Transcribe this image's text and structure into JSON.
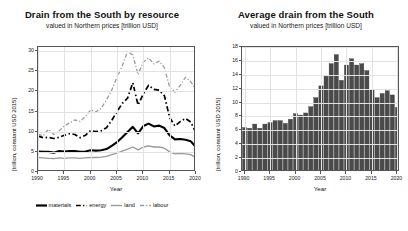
{
  "figure": {
    "background": "#ffffff",
    "panels": [
      "left",
      "right"
    ]
  },
  "left_panel": {
    "title": "Drain from the South by resource",
    "subtitle": "valued in Northern prices [trillion USD]",
    "ylabel": "[trillion, constant USD 2015]",
    "xlabel": "Year",
    "legend": [
      {
        "label": "materials",
        "color": "#000000",
        "style": "solid",
        "width": 2.2
      },
      {
        "label": "energy",
        "color": "#000000",
        "style": "dashdot",
        "width": 1.6
      },
      {
        "label": "land",
        "color": "#9a9a9a",
        "style": "solid",
        "width": 1.4
      },
      {
        "label": "labour",
        "color": "#9a9a9a",
        "style": "dashdot",
        "width": 1.4
      }
    ]
  },
  "right_panel": {
    "title": "Average drain from the South",
    "subtitle": "valued in Northern prices [trillion USD]",
    "ylabel": "[trillion, constant USD 2015]",
    "xlabel": "Year",
    "bar_color": "#4a4a4a"
  },
  "chart_data": [
    {
      "type": "line",
      "id": "drain-by-resource",
      "title": "Drain from the South by resource",
      "subtitle": "valued in Northern prices [trillion USD]",
      "xlabel": "Year",
      "ylabel": "[trillion, constant USD 2015]",
      "xlim": [
        1990,
        2020
      ],
      "ylim": [
        0,
        31
      ],
      "xticks": [
        1990,
        1995,
        2000,
        2005,
        2010,
        2015,
        2020
      ],
      "yticks": [
        0,
        5,
        10,
        15,
        20,
        25,
        30
      ],
      "grid": true,
      "legend_position": "below",
      "x": [
        1990,
        1991,
        1992,
        1993,
        1994,
        1995,
        1996,
        1997,
        1998,
        1999,
        2000,
        2001,
        2002,
        2003,
        2004,
        2005,
        2006,
        2007,
        2008,
        2009,
        2010,
        2011,
        2012,
        2013,
        2014,
        2015,
        2016,
        2017,
        2018,
        2019,
        2020
      ],
      "series": [
        {
          "name": "materials",
          "color": "#000000",
          "style": "solid",
          "values": [
            5.1,
            5.0,
            5.0,
            4.8,
            5.2,
            5.1,
            5.2,
            5.2,
            5.0,
            5.1,
            5.4,
            5.3,
            5.4,
            5.7,
            6.5,
            7.4,
            8.6,
            9.9,
            11.2,
            9.6,
            11.4,
            12.0,
            11.3,
            11.5,
            10.9,
            9.1,
            8.1,
            8.2,
            8.0,
            7.6,
            6.2
          ]
        },
        {
          "name": "energy",
          "color": "#000000",
          "style": "dashdot",
          "values": [
            8.9,
            8.5,
            8.6,
            8.3,
            8.6,
            9.1,
            9.5,
            9.3,
            8.5,
            9.1,
            10.3,
            10.0,
            10.2,
            11.0,
            12.8,
            15.0,
            17.0,
            18.3,
            22.1,
            16.6,
            19.4,
            21.5,
            20.5,
            20.3,
            18.9,
            13.5,
            11.4,
            12.5,
            13.3,
            12.4,
            9.7
          ]
        },
        {
          "name": "land",
          "color": "#9a9a9a",
          "style": "solid",
          "values": [
            3.6,
            3.5,
            3.4,
            3.3,
            3.5,
            3.4,
            3.5,
            3.5,
            3.4,
            3.5,
            3.6,
            3.6,
            3.7,
            3.9,
            4.3,
            4.7,
            5.2,
            5.7,
            6.2,
            5.5,
            6.2,
            6.5,
            6.2,
            6.2,
            5.9,
            5.0,
            4.5,
            4.6,
            4.5,
            4.3,
            3.6
          ]
        },
        {
          "name": "labour",
          "color": "#9a9a9a",
          "style": "dashdot",
          "values": [
            9.4,
            9.0,
            10.6,
            9.3,
            10.2,
            11.4,
            12.2,
            12.9,
            12.5,
            13.8,
            15.4,
            14.9,
            15.8,
            17.9,
            20.3,
            23.5,
            26.3,
            29.9,
            29.0,
            24.2,
            27.3,
            28.3,
            26.8,
            27.5,
            25.9,
            21.0,
            19.8,
            21.5,
            23.5,
            22.4,
            20.4
          ]
        }
      ]
    },
    {
      "type": "bar",
      "id": "average-drain",
      "title": "Average drain from the South",
      "subtitle": "valued in Northern prices [trillion USD]",
      "xlabel": "Year",
      "ylabel": "[trillion, constant USD 2015]",
      "xlim": [
        1989.5,
        2020.5
      ],
      "ylim": [
        0,
        18
      ],
      "xticks": [
        1990,
        1995,
        2000,
        2005,
        2010,
        2015,
        2020
      ],
      "yticks": [
        0,
        2,
        4,
        6,
        8,
        10,
        12,
        14,
        16,
        18
      ],
      "grid": true,
      "categories": [
        1990,
        1991,
        1992,
        1993,
        1994,
        1995,
        1996,
        1997,
        1998,
        1999,
        2000,
        2001,
        2002,
        2003,
        2004,
        2005,
        2006,
        2007,
        2008,
        2009,
        2010,
        2011,
        2012,
        2013,
        2014,
        2015,
        2016,
        2017,
        2018,
        2019,
        2020
      ],
      "values": [
        6.4,
        6.3,
        6.9,
        6.3,
        6.9,
        7.1,
        7.4,
        7.4,
        7.0,
        7.6,
        8.4,
        8.2,
        8.5,
        9.4,
        10.7,
        12.4,
        13.8,
        15.6,
        16.9,
        13.2,
        15.4,
        16.3,
        15.4,
        15.6,
        14.6,
        11.8,
        10.7,
        11.3,
        11.7,
        11.1,
        9.3
      ]
    }
  ]
}
